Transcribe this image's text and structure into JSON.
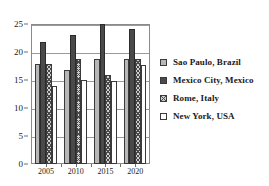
{
  "chart_data": {
    "type": "bar",
    "title": "",
    "subtitle": "",
    "xlabel": "",
    "ylabel": "",
    "categories": [
      "2005",
      "2010",
      "2015",
      "2020"
    ],
    "ylim": [
      0,
      25
    ],
    "yticks": [
      0,
      5,
      10,
      15,
      20,
      25
    ],
    "ytick_labels": [
      "0",
      "5",
      "10",
      "15",
      "20",
      "25"
    ],
    "grid": true,
    "legend_position": "right",
    "series": [
      {
        "name": "Sao Paulo, Brazil",
        "values": [
          17.8,
          16.8,
          18.8,
          18.7
        ],
        "color": "#b7b7b7",
        "pattern": "solid-light-gray"
      },
      {
        "name": "Mexico City, Mexico",
        "values": [
          21.8,
          23.0,
          25.0,
          24.1
        ],
        "color": "#4a4a4a",
        "pattern": "solid-dark"
      },
      {
        "name": "Rome, Italy",
        "values": [
          17.8,
          18.7,
          15.9,
          18.8
        ],
        "color": "#cfcfcf",
        "pattern": "cross-hatch"
      },
      {
        "name": "New York, USA",
        "values": [
          13.9,
          15.0,
          14.9,
          17.7
        ],
        "color": "#ffffff",
        "pattern": "empty-white"
      }
    ]
  },
  "legend": {
    "items": [
      {
        "label": "Sao Paulo, Brazil",
        "swatch": "legend-swatch-sao-paulo"
      },
      {
        "label": "Mexico City, Mexico",
        "swatch": "legend-swatch-mexico-city"
      },
      {
        "label": "Rome, Italy",
        "swatch": "legend-swatch-rome"
      },
      {
        "label": "New York, USA",
        "swatch": "legend-swatch-new-york"
      }
    ]
  }
}
